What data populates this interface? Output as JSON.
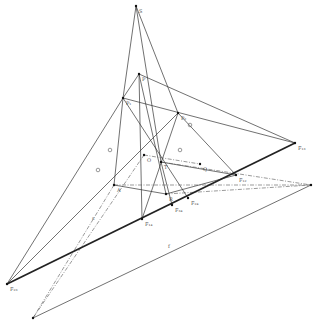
{
  "diagram": {
    "type": "projective-geometry-construction",
    "width": 313,
    "height": 320,
    "colors": {
      "background": "#ffffff",
      "line": "#333333",
      "thick_line": "#222222",
      "dashed": "#555555",
      "label": "#666666",
      "point": "#111111"
    },
    "points": [
      {
        "id": "S",
        "x": 136,
        "y": 6,
        "label": "S"
      },
      {
        "id": "P",
        "x": 139,
        "y": 74,
        "label": "P"
      },
      {
        "id": "P1",
        "x": 123,
        "y": 98,
        "label": "P₁"
      },
      {
        "id": "P2",
        "x": 178,
        "y": 113,
        "label": "P₂"
      },
      {
        "id": "O",
        "x": 144,
        "y": 155,
        "label": "O"
      },
      {
        "id": "T",
        "x": 161,
        "y": 162,
        "label": "T"
      },
      {
        "id": "Q",
        "x": 200,
        "y": 164,
        "label": "Q"
      },
      {
        "id": "A",
        "x": 114,
        "y": 185,
        "label": "A"
      },
      {
        "id": "R",
        "x": 166,
        "y": 194,
        "label": "R"
      },
      {
        "id": "F13",
        "x": 295,
        "y": 143,
        "label": "F₁₃"
      },
      {
        "id": "F12",
        "x": 236,
        "y": 175,
        "label": "F₁₂"
      },
      {
        "id": "F24",
        "x": 188,
        "y": 198,
        "label": "F₂₄"
      },
      {
        "id": "F34",
        "x": 172,
        "y": 205,
        "label": "F₃₄"
      },
      {
        "id": "F14",
        "x": 142,
        "y": 219,
        "label": "F₁₄"
      },
      {
        "id": "F23",
        "x": 7,
        "y": 284,
        "label": "F₂₃"
      },
      {
        "id": "Vr",
        "x": 311,
        "y": 185,
        "label": ""
      },
      {
        "id": "Vb",
        "x": 33,
        "y": 318,
        "label": ""
      }
    ],
    "line_labels": [
      {
        "text": "s",
        "x": 92,
        "y": 220
      },
      {
        "text": "f",
        "x": 168,
        "y": 248
      }
    ],
    "thick_lines": [
      {
        "from": "F23",
        "to": "F13"
      }
    ],
    "thin_lines": [
      {
        "from": "S",
        "to": "P1"
      },
      {
        "from": "S",
        "to": "P2"
      },
      {
        "from": "S",
        "to": "T"
      },
      {
        "from": "P",
        "to": "P1"
      },
      {
        "from": "P",
        "to": "F13"
      },
      {
        "from": "P",
        "to": "F14"
      },
      {
        "from": "P",
        "to": "R"
      },
      {
        "from": "P1",
        "to": "F23"
      },
      {
        "from": "P1",
        "to": "F13"
      },
      {
        "from": "P1",
        "to": "F24"
      },
      {
        "from": "P1",
        "to": "A"
      },
      {
        "from": "P2",
        "to": "F14"
      },
      {
        "from": "P2",
        "to": "F12"
      },
      {
        "from": "P2",
        "to": "F23"
      },
      {
        "from": "T",
        "to": "F34"
      },
      {
        "from": "T",
        "to": "F12"
      },
      {
        "from": "A",
        "to": "R"
      },
      {
        "from": "R",
        "to": "F12"
      },
      {
        "from": "Vr",
        "to": "Vb"
      }
    ],
    "dashed_lines": [
      {
        "from": "O",
        "to": "Vb"
      },
      {
        "from": "A",
        "to": "Vb"
      },
      {
        "from": "T",
        "to": "Vr"
      },
      {
        "from": "A",
        "to": "Vr"
      },
      {
        "from": "O",
        "to": "Q"
      },
      {
        "from": "R",
        "to": "Vr"
      }
    ],
    "tick_marks": [
      {
        "x": 110,
        "y": 150
      },
      {
        "x": 98,
        "y": 170
      },
      {
        "x": 190,
        "y": 125
      },
      {
        "x": 180,
        "y": 150
      }
    ]
  }
}
